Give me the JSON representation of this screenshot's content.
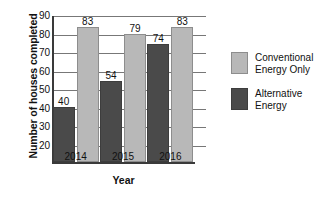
{
  "chart_data": {
    "type": "bar",
    "title": "",
    "xlabel": "Year",
    "ylabel": "Number of houses completed",
    "categories": [
      "2014",
      "2015",
      "2016"
    ],
    "series": [
      {
        "name": "Alternative Energy",
        "color": "#4a4a4a",
        "values": [
          40,
          54,
          74
        ]
      },
      {
        "name": "Conventional Energy Only",
        "color": "#b8b8b8",
        "values": [
          83,
          79,
          83
        ]
      }
    ],
    "ylim": [
      10,
      90
    ],
    "ytick_labels": [
      "90",
      "80",
      "70",
      "60",
      "50",
      "40",
      "30",
      "20"
    ],
    "ytick_values": [
      90,
      80,
      70,
      60,
      50,
      40,
      30,
      20
    ],
    "grid": true,
    "legend_position": "right",
    "data_labels": [
      "40",
      "83",
      "54",
      "79",
      "74",
      "83"
    ]
  },
  "legend": {
    "entries": [
      {
        "label": "Conventional\nEnergy Only",
        "swatch": "conv"
      },
      {
        "label": "Alternative\nEnergy",
        "swatch": "alt"
      }
    ]
  }
}
